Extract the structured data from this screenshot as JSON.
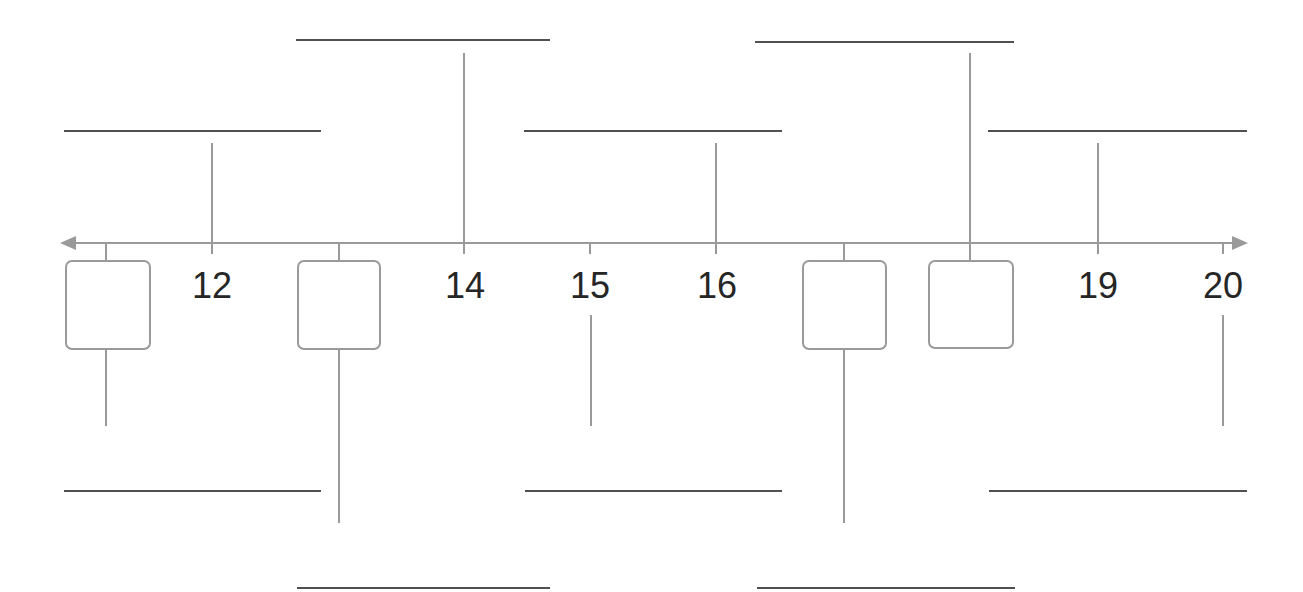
{
  "diagram": {
    "type": "timeline-worksheet",
    "axis": {
      "y": 243,
      "x_start": 62,
      "x_end": 1248,
      "color": "#9a9a9a",
      "arrows": [
        "left",
        "right"
      ]
    },
    "colors": {
      "axis": "#9a9a9a",
      "answer_line": "#505050",
      "text": "#262626",
      "background": "#ffffff"
    },
    "points": [
      {
        "value": "11",
        "x": 106,
        "label_visible": false,
        "box": {
          "left": 65,
          "width": 86
        },
        "answer_side": "below",
        "stem": [
          349,
          425
        ],
        "line": {
          "y": 491,
          "x1": 64,
          "x2": 321
        }
      },
      {
        "value": "12",
        "x": 212,
        "label_visible": true,
        "label": "12",
        "answer_side": "above",
        "stem": [
          143,
          243
        ],
        "line": {
          "y": 131,
          "x1": 64,
          "x2": 321
        }
      },
      {
        "value": "13",
        "x": 339,
        "label_visible": false,
        "box": {
          "left": 297,
          "width": 84
        },
        "answer_side": "below",
        "stem": [
          349,
          522
        ],
        "line": {
          "y": 588,
          "x1": 297,
          "x2": 550
        }
      },
      {
        "value": "14",
        "x": 464,
        "label_visible": true,
        "label": "14",
        "answer_side": "above",
        "stem": [
          53,
          243
        ],
        "line": {
          "y": 40,
          "x1": 296,
          "x2": 550
        }
      },
      {
        "value": "15",
        "x": 590,
        "label_visible": true,
        "label": "15",
        "answer_side": "below",
        "stem": [
          315,
          425
        ],
        "line": {
          "y": 491,
          "x1": 525,
          "x2": 782
        }
      },
      {
        "value": "16",
        "x": 716,
        "label_visible": true,
        "label": "16",
        "answer_side": "above",
        "stem": [
          143,
          243
        ],
        "line": {
          "y": 131,
          "x1": 524,
          "x2": 782
        }
      },
      {
        "value": "17",
        "x": 843,
        "label_visible": false,
        "box": {
          "left": 802,
          "width": 85
        },
        "answer_side": "below",
        "stem": [
          349,
          522
        ],
        "line": {
          "y": 588,
          "x1": 757,
          "x2": 1015
        }
      },
      {
        "value": "18",
        "x": 969,
        "label_visible": false,
        "box": {
          "left": 928,
          "width": 86
        },
        "answer_side": "above",
        "stem": [
          53,
          243
        ],
        "line": {
          "y": 42,
          "x1": 755,
          "x2": 1014
        }
      },
      {
        "value": "19",
        "x": 1098,
        "label_visible": true,
        "label": "19",
        "answer_side": "above",
        "stem": [
          143,
          243
        ],
        "line": {
          "y": 131,
          "x1": 988,
          "x2": 1247
        }
      },
      {
        "value": "20",
        "x": 1223,
        "label_visible": true,
        "label": "20",
        "answer_side": "below",
        "stem": [
          315,
          425
        ],
        "line": {
          "y": 491,
          "x1": 989,
          "x2": 1247
        }
      }
    ],
    "labels": {
      "p12": "12",
      "p14": "14",
      "p15": "15",
      "p16": "16",
      "p19": "19",
      "p20": "20"
    }
  }
}
